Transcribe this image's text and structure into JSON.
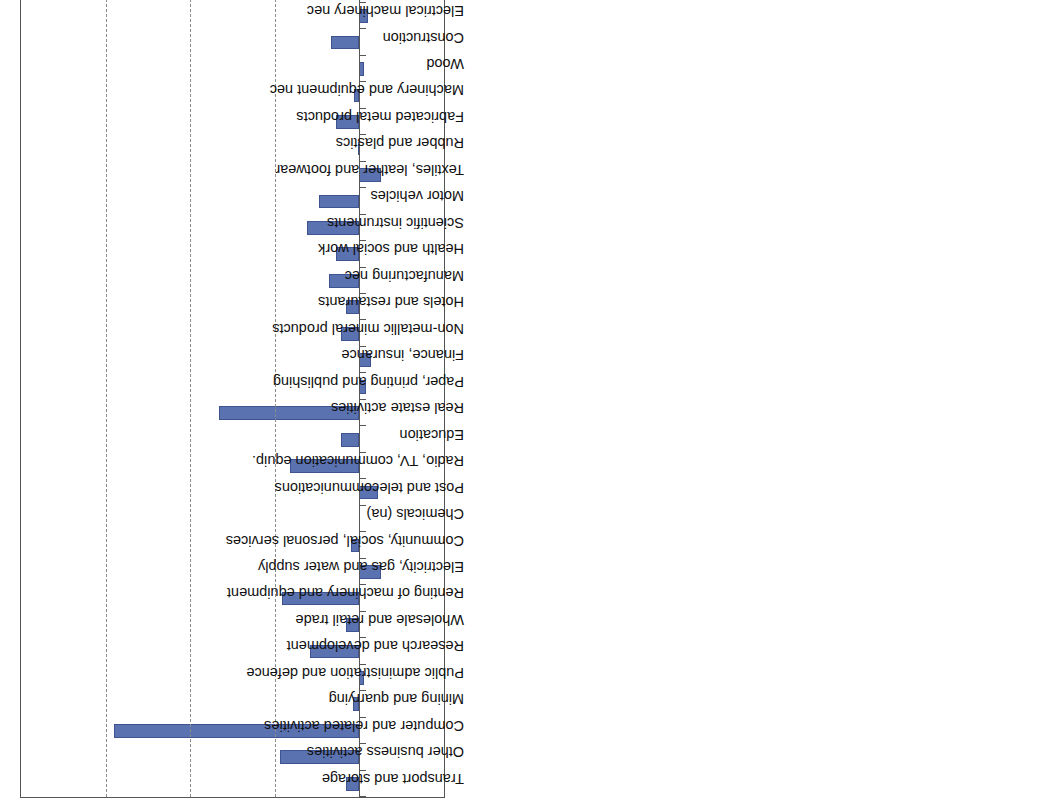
{
  "chart_data": {
    "type": "bar",
    "title": "",
    "xlabel": "",
    "ylabel": "%",
    "unit": "%",
    "ylim": [
      -50,
      200
    ],
    "yticks": [
      -50,
      0,
      50,
      100,
      150,
      200
    ],
    "gridlines": [
      50,
      100,
      150
    ],
    "grid": true,
    "legend": "none",
    "orientation": "vertical-bars-on-rotated-page",
    "bar_color": "#5b72b0",
    "categories": [
      "Transport and storage",
      "Other business activities",
      "Computer and related activities",
      "Mining and quarrying",
      "Public administration and defence",
      "Research and development",
      "Wholesale and retail trade",
      "Renting of machinery and equipment",
      "Electricity, gas and water supply",
      "Community, social, personal services",
      "Chemicals (na)",
      "Post and telecommunications",
      "Radio, TV, communication equip.",
      "Education",
      "Real estate activities",
      "Paper, printing and publishing",
      "Finance, insurance",
      "Non-metallic mineral products",
      "Hotels and restaurants",
      "Manufacturing nec",
      "Health and social work",
      "Scientific instruments",
      "Motor vehicles",
      "Textiles, leather and footwear",
      "Rubber and plastics",
      "Fabricated metal products",
      "Machinery and equipment nec",
      "Wood",
      "Construction",
      "Electrical machinery nec",
      "Food, beverages and tobacco",
      "Coke, refined petroleum (na)",
      "Other transport equipment",
      "Basic metals",
      "Agriculture, forestry and fishing",
      "Office machinery and computers"
    ],
    "values": [
      8,
      47,
      145,
      4,
      -3,
      29,
      8,
      46,
      -13,
      5,
      null,
      -11,
      41,
      11,
      83,
      -4,
      -7,
      11,
      8,
      18,
      14,
      31,
      24,
      -13,
      1,
      14,
      3,
      -3,
      17,
      -5,
      2,
      null,
      -5,
      -7,
      -9,
      -32
    ]
  },
  "axis": {
    "tick_labels": [
      "-50",
      "0",
      "50",
      "100",
      "150",
      "200"
    ],
    "unit_label": "%"
  }
}
